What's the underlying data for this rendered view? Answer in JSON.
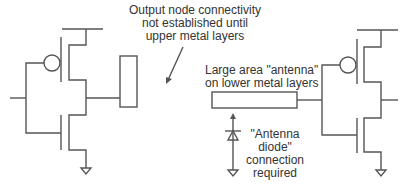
{
  "labels": {
    "output_note": [
      "Output node connectivity",
      "not established until",
      "upper metal layers"
    ],
    "antenna_note": [
      "Large area \"antenna\"",
      "on lower metal layers"
    ],
    "diode_note": [
      "\"Antenna",
      "diode\"",
      "connection",
      "required"
    ]
  },
  "colors": {
    "wire": "#555555",
    "text": "#333333",
    "background": "#ffffff"
  }
}
